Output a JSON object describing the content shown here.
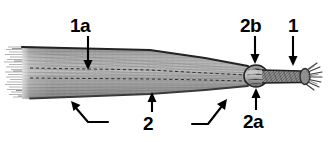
{
  "figure": {
    "kind": "annotated-grayscale-specimen-illustration",
    "background_color": "#ffffff",
    "ink_color": "#000000",
    "body_gray": "#9a9a9a",
    "body_gray_dark": "#6e6e6e",
    "body_gray_light": "#c9c9c9",
    "outline_color": "#2a2a2a"
  },
  "labels": [
    {
      "id": "1a",
      "text": "1a",
      "position": "top-left",
      "pointer": "arrow-down"
    },
    {
      "id": "2",
      "text": "2",
      "position": "bottom-center",
      "pointer": "arrow-up"
    },
    {
      "id": "2b",
      "text": "2b",
      "position": "top-right",
      "pointer": "arrow-down"
    },
    {
      "id": "1",
      "text": "1",
      "position": "top-far-right",
      "pointer": "arrow-down"
    },
    {
      "id": "2a",
      "text": "2a",
      "position": "bottom-right",
      "pointer": "arrow-up"
    }
  ],
  "leaders": [
    {
      "id": "leader-left",
      "type": "elbow",
      "points": "bottom-left elbow pointing up-left to specimen lower edge"
    },
    {
      "id": "leader-center",
      "type": "elbow",
      "points": "bottom-center elbow pointing up-right to specimen lower edge"
    }
  ],
  "parts": {
    "frayed_left_end": "splayed fibre bundle at left terminus",
    "tapering_shaft": "long striated shaft narrowing left to right",
    "dashed_midlines": "two horizontal dashed lines along the shaft interior",
    "node": "bulbous swelling at the right, between the 2b and 2a arrows",
    "narrow_stem": "slender textured stem right of the node",
    "brush_tip": "frayed brush-like tip at right terminus"
  }
}
